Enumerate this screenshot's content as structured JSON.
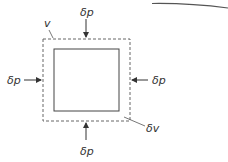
{
  "diagram": {
    "volume_label": "v",
    "volume_change_label": "δv",
    "pressure_labels": {
      "top": "δp",
      "bottom": "δp",
      "left": "δp",
      "right": "δp"
    }
  },
  "colors": {
    "line": "#444444",
    "dashed": "#666666",
    "text": "#333333",
    "background": "#ffffff"
  }
}
